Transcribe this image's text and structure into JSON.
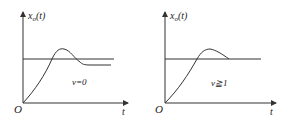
{
  "panels": [
    {
      "y_label": "x",
      "y_sub": "o",
      "y_arg": "(t)",
      "origin": "O",
      "x_label": "t",
      "annotation": "v=0"
    },
    {
      "y_label": "x",
      "y_sub": "o",
      "y_arg": "(t)",
      "origin": "O",
      "x_label": "t",
      "annotation": "v≧1"
    }
  ],
  "colors": {
    "stroke": "#333333"
  }
}
